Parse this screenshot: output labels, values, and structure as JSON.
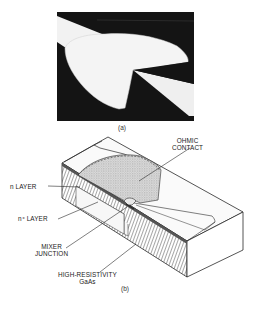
{
  "figure": {
    "panel_a": {
      "caption": "(a)",
      "description": "Micrograph of fan-shaped ohmic contact with tapered probe electrode"
    },
    "panel_b": {
      "caption": "(b)",
      "labels": {
        "ohmic_contact_line1": "OHMIC",
        "ohmic_contact_line2": "CONTACT",
        "n_layer": "n LAYER",
        "n_plus_layer": "n⁺ LAYER",
        "mixer_junction_line1": "MIXER",
        "mixer_junction_line2": "JUNCTION",
        "substrate_line1": "HIGH-RESISTIVITY",
        "substrate_line2": "GaAs"
      }
    }
  },
  "colors": {
    "photo_background": "#141414",
    "metal": "#f4f4f4",
    "line": "#2a2a2a",
    "stipple": "#cfcfcf",
    "layer": "#555555"
  }
}
